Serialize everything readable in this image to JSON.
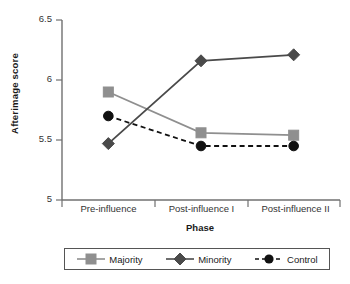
{
  "chart_data": {
    "type": "line",
    "title": "",
    "xlabel": "Phase",
    "ylabel": "Afterimage score",
    "categories": [
      "Pre-influence",
      "Post-influence I",
      "Post-influence II"
    ],
    "ylim": [
      5,
      6.5
    ],
    "yticks": [
      "5",
      "5.5",
      "6",
      "6.5"
    ],
    "ytick_values": [
      5,
      5.5,
      6,
      6.5
    ],
    "grid": false,
    "legend_position": "bottom",
    "series": [
      {
        "name": "Majority",
        "values": [
          5.9,
          5.56,
          5.54
        ],
        "color": "#8f8f8f",
        "marker": "square",
        "linestyle": "solid"
      },
      {
        "name": "Minority",
        "values": [
          5.47,
          6.16,
          6.21
        ],
        "color": "#4a4a4a",
        "marker": "diamond",
        "linestyle": "solid"
      },
      {
        "name": "Control",
        "values": [
          5.7,
          5.45,
          5.45
        ],
        "color": "#111111",
        "marker": "circle",
        "linestyle": "dashed"
      }
    ]
  },
  "axis": {
    "y_title": "Afterimage score",
    "x_title": "Phase",
    "y_labels": [
      "6.5",
      "6",
      "5.5",
      "5"
    ],
    "x_labels": [
      "Pre-influence",
      "Post-influence I",
      "Post-influence II"
    ]
  },
  "legend": {
    "items": [
      {
        "label": "Majority"
      },
      {
        "label": "Minority"
      },
      {
        "label": "Control"
      }
    ]
  },
  "colors": {
    "majority": "#8f8f8f",
    "minority": "#4a4a4a",
    "control": "#111111",
    "axis": "#707070",
    "text": "#1a1a1a"
  }
}
